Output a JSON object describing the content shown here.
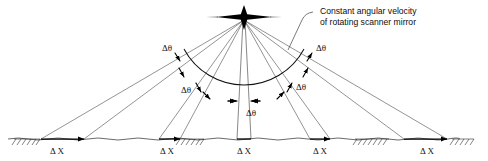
{
  "figure": {
    "background_color": "#ffffff",
    "ink_color": "#111111",
    "width": 488,
    "height": 161
  },
  "callout": {
    "line1": "Constant angular velocity",
    "line2": "of rotating scanner mirror",
    "leader_target": "scanner-mirror-apex"
  },
  "apex": {
    "name": "scanner-mirror-apex",
    "icon": "four-point-star-icon",
    "x": 244,
    "y": 17
  },
  "arc": {
    "name": "constant-angular-velocity-arc",
    "center_x": 244,
    "center_y": 17,
    "radius": 68,
    "start_angle_deg": 208,
    "end_angle_deg": 332
  },
  "ground": {
    "name": "ground-line",
    "y": 139,
    "x_start": 8,
    "x_end": 480,
    "hatched_segments": [
      {
        "x": 14,
        "width": 26
      },
      {
        "x": 178,
        "width": 26
      },
      {
        "x": 355,
        "width": 34
      },
      {
        "x": 452,
        "width": 22
      }
    ]
  },
  "delta_x_labels": [
    {
      "id": "dx-1",
      "text": "Δ X",
      "x": 57,
      "y": 153,
      "bar_x1": 41,
      "bar_x2": 84
    },
    {
      "id": "dx-2",
      "text": "Δ X",
      "x": 167,
      "y": 153,
      "bar_x1": 159,
      "bar_x2": 180
    },
    {
      "id": "dx-3",
      "text": "Δ X",
      "x": 244,
      "y": 153,
      "bar_x1": 237,
      "bar_x2": 251
    },
    {
      "id": "dx-4",
      "text": "Δ X",
      "x": 320,
      "y": 153,
      "bar_x1": 310,
      "bar_x2": 330
    },
    {
      "id": "dx-5",
      "text": "Δ X",
      "x": 427,
      "y": 153,
      "bar_x1": 404,
      "bar_x2": 447
    }
  ],
  "delta_theta_labels": [
    {
      "id": "dtheta-left-outer",
      "text": "Δθ",
      "x": 172,
      "y": 50
    },
    {
      "id": "dtheta-left-inner",
      "text": "Δθ",
      "x": 191,
      "y": 92
    },
    {
      "id": "dtheta-center",
      "text": "Δθ",
      "x": 251,
      "y": 115
    },
    {
      "id": "dtheta-right-inner",
      "text": "Δθ",
      "x": 303,
      "y": 89
    },
    {
      "id": "dtheta-right-outer",
      "text": "Δθ",
      "x": 323,
      "y": 50
    }
  ],
  "ray_pairs": [
    {
      "id": "ray-pair-1",
      "ground_x1": 41,
      "ground_x2": 84,
      "label": "dtheta-left-outer"
    },
    {
      "id": "ray-pair-2",
      "ground_x1": 159,
      "ground_x2": 180,
      "label": "dtheta-left-inner"
    },
    {
      "id": "ray-pair-3",
      "ground_x1": 237,
      "ground_x2": 251,
      "label": "dtheta-center"
    },
    {
      "id": "ray-pair-4",
      "ground_x1": 310,
      "ground_x2": 330,
      "label": "dtheta-right-inner"
    },
    {
      "id": "ray-pair-5",
      "ground_x1": 404,
      "ground_x2": 447,
      "label": "dtheta-right-outer"
    }
  ],
  "tick_marks": [
    {
      "id": "tick-left-outer-a",
      "x": 178,
      "y": 58
    },
    {
      "id": "tick-left-outer-b",
      "x": 182,
      "y": 73
    },
    {
      "id": "tick-left-inner-a",
      "x": 199,
      "y": 88
    },
    {
      "id": "tick-left-inner-b",
      "x": 207,
      "y": 96
    },
    {
      "id": "tick-center-a",
      "x": 235,
      "y": 101
    },
    {
      "id": "tick-center-b",
      "x": 253,
      "y": 101
    },
    {
      "id": "tick-right-inner-a",
      "x": 281,
      "y": 95
    },
    {
      "id": "tick-right-inner-b",
      "x": 290,
      "y": 87
    },
    {
      "id": "tick-right-outer-a",
      "x": 306,
      "y": 72
    },
    {
      "id": "tick-right-outer-b",
      "x": 311,
      "y": 58
    }
  ]
}
